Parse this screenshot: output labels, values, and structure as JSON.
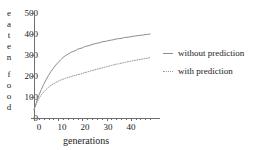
{
  "chart_data": {
    "type": "line",
    "title": "",
    "xlabel": "generations",
    "ylabel": "eaten food",
    "ylabel_letters": [
      "e",
      "a",
      "t",
      "e",
      "n",
      "f",
      "o",
      "o",
      "d"
    ],
    "xlim": [
      0,
      48
    ],
    "ylim": [
      0,
      500
    ],
    "xticks": [
      0,
      10,
      20,
      30,
      40
    ],
    "yticks": [
      0,
      100,
      200,
      300,
      400,
      500
    ],
    "grid": false,
    "legend_position": "right",
    "x": [
      0,
      1,
      2,
      3,
      4,
      5,
      6,
      7,
      8,
      9,
      10,
      11,
      12,
      13,
      14,
      15,
      16,
      17,
      18,
      19,
      20,
      21,
      22,
      23,
      24,
      25,
      26,
      27,
      28,
      29,
      30,
      31,
      32,
      33,
      34,
      35,
      36,
      37,
      38,
      39,
      40,
      41,
      42,
      43,
      44,
      45,
      46,
      47,
      48
    ],
    "series": [
      {
        "name": "without prediction",
        "style": "solid",
        "color": "#8c8c8c",
        "values": [
          40,
          75,
          108,
          135,
          160,
          182,
          203,
          221,
          237,
          252,
          265,
          277,
          288,
          297,
          303,
          311,
          316,
          320,
          327,
          331,
          334,
          340,
          343,
          345,
          350,
          353,
          356,
          358,
          362,
          364,
          366,
          369,
          371,
          373,
          376,
          378,
          379,
          382,
          384,
          385,
          387,
          389,
          391,
          392,
          394,
          395,
          397,
          398,
          400
        ]
      },
      {
        "name": "with prediction",
        "style": "dotted",
        "color": "#9a9a9a",
        "values": [
          40,
          68,
          92,
          110,
          124,
          136,
          146,
          155,
          162,
          169,
          175,
          180,
          185,
          189,
          193,
          196,
          200,
          203,
          206,
          209,
          212,
          216,
          219,
          222,
          226,
          229,
          232,
          235,
          238,
          241,
          244,
          247,
          250,
          253,
          256,
          258,
          261,
          263,
          266,
          268,
          270,
          273,
          275,
          277,
          279,
          281,
          283,
          285,
          288
        ]
      }
    ]
  },
  "legend": {
    "items": [
      {
        "label": "without prediction"
      },
      {
        "label": "with prediction"
      }
    ]
  },
  "axes": {
    "x_title": "generations",
    "y_letters": [
      "e",
      "a",
      "t",
      "e",
      "n",
      "f",
      "o",
      "o",
      "d"
    ],
    "x_tick_labels": [
      "0",
      "10",
      "20",
      "30",
      "40"
    ],
    "y_tick_labels": [
      "0",
      "100",
      "200",
      "300",
      "400",
      "500"
    ]
  },
  "colors": {
    "axis": "#6e6e6e",
    "text": "#222222",
    "series_solid": "#8c8c8c",
    "series_dotted": "#9a9a9a",
    "background": "#ffffff"
  }
}
